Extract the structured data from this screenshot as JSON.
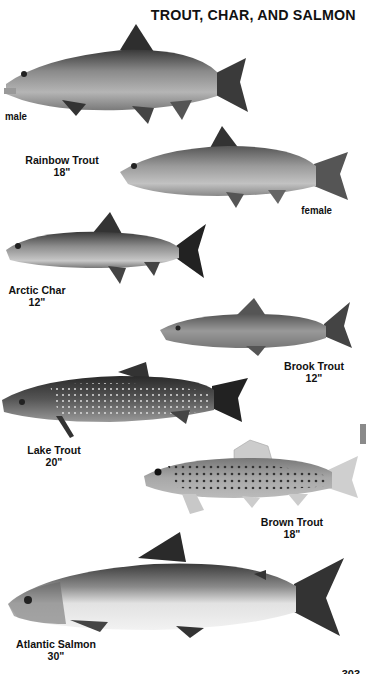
{
  "page": {
    "title": "TROUT, CHAR, AND SALMON",
    "page_number": "303"
  },
  "fish": [
    {
      "name": "Rainbow Trout",
      "size": "18\"",
      "variants": [
        {
          "label": "male"
        },
        {
          "label": "female"
        }
      ]
    },
    {
      "name": "Arctic Char",
      "size": "12\""
    },
    {
      "name": "Brook Trout",
      "size": "12\""
    },
    {
      "name": "Lake Trout",
      "size": "20\""
    },
    {
      "name": "Brown Trout",
      "size": "18\""
    },
    {
      "name": "Atlantic Salmon",
      "size": "30\""
    }
  ],
  "colors": {
    "text": "#111111",
    "edge_tab": "#8a8a8a"
  }
}
